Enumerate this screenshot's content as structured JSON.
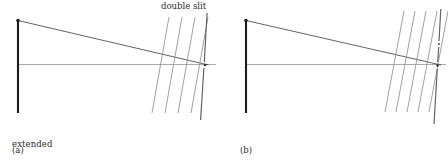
{
  "figure": {
    "width": 448,
    "height": 162,
    "background": "#ffffff",
    "colors": {
      "source_line": "#1a1a1a",
      "ray_line": "#3a3a3a",
      "axis_line": "#9a9a9a",
      "wavefront_line": "#8c8c8c",
      "screen_line": "#6a6a6a",
      "text": "#2b2b2b"
    }
  },
  "labels": {
    "double_slit": "double slit",
    "extended_source_line1": "extended",
    "extended_source_line2": "source",
    "panel_a": "(a)",
    "panel_b": "(b)"
  },
  "panels": [
    {
      "id": "a",
      "tag": "(a)",
      "source": {
        "x": 18,
        "y_top": 20,
        "y_bottom": 113,
        "label": "extended source",
        "emitter_dot": {
          "x": 18,
          "y": 20
        }
      },
      "optical_axis": {
        "x1": 18,
        "y1": 64.5,
        "x2": 215,
        "y2": 64.5
      },
      "rays": [
        {
          "from_x": 18,
          "from_y": 20,
          "to_x": 208,
          "to_y": 65
        },
        {
          "from_x": 18,
          "from_y": 64.5,
          "to_x": 208,
          "to_y": 65
        }
      ],
      "wavefronts": [
        {
          "x1": 168,
          "y1": 18,
          "x2": 152,
          "y2": 112
        },
        {
          "x1": 181,
          "y1": 18,
          "x2": 165,
          "y2": 112
        },
        {
          "x1": 194,
          "y1": 18,
          "x2": 178,
          "y2": 112
        },
        {
          "x1": 207,
          "y1": 18,
          "x2": 191,
          "y2": 112
        }
      ],
      "screen": {
        "x_top": 206,
        "y_top": 14,
        "x_bottom": 200,
        "y_bottom": 118,
        "slit_count": 1,
        "gaps": [
          {
            "y_start": 62,
            "y_end": 68
          }
        ]
      }
    },
    {
      "id": "b",
      "tag": "(b)",
      "source": {
        "x": 246,
        "y_top": 20,
        "y_bottom": 113,
        "emitter_dot": {
          "x": 246,
          "y": 20
        }
      },
      "optical_axis": {
        "x1": 246,
        "y1": 64.5,
        "x2": 444,
        "y2": 64.5
      },
      "rays": [
        {
          "from_x": 246,
          "from_y": 20,
          "to_x": 440,
          "to_y": 65
        },
        {
          "from_x": 246,
          "from_y": 64.5,
          "to_x": 440,
          "to_y": 65
        }
      ],
      "wavefronts": [
        {
          "x1": 404,
          "y1": 12,
          "x2": 385,
          "y2": 110
        },
        {
          "x1": 415,
          "y1": 12,
          "x2": 396,
          "y2": 110
        },
        {
          "x1": 426,
          "y1": 12,
          "x2": 407,
          "y2": 110
        },
        {
          "x1": 437,
          "y1": 12,
          "x2": 418,
          "y2": 110
        },
        {
          "x1": 448,
          "y1": 12,
          "x2": 429,
          "y2": 110
        }
      ],
      "screen": {
        "x_top": 440,
        "y_top": 10,
        "x_bottom": 434,
        "y_bottom": 122,
        "slit_count": 2,
        "gaps": [
          {
            "y_start": 41,
            "y_end": 47
          },
          {
            "y_start": 63,
            "y_end": 69
          }
        ]
      }
    }
  ]
}
